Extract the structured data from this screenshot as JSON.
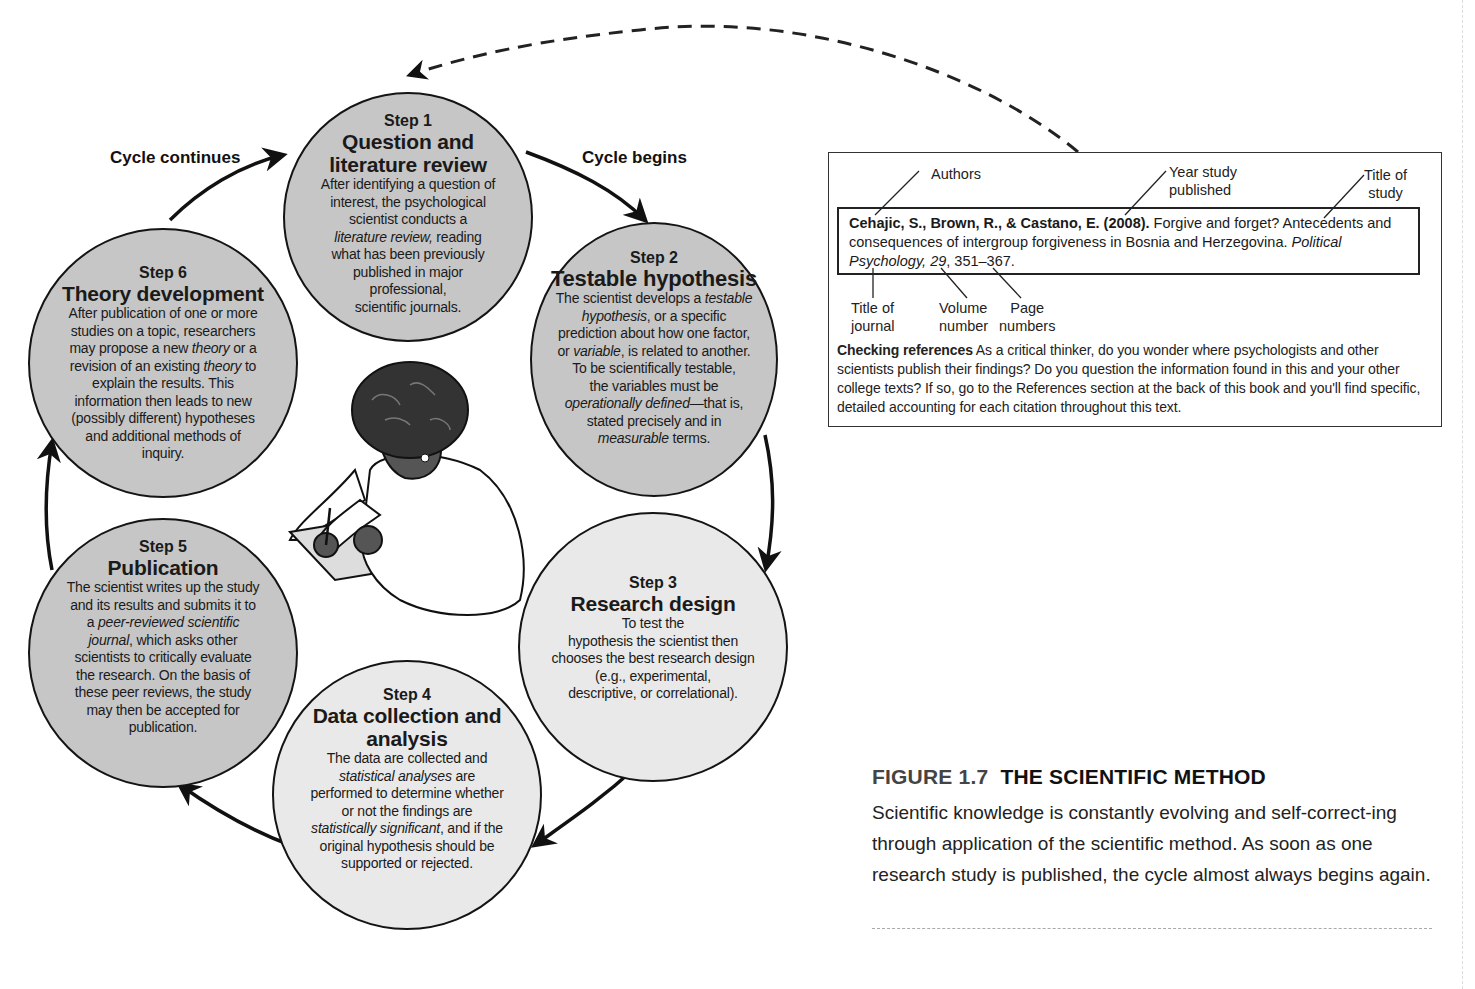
{
  "figure": {
    "number": "FIGURE 1.7",
    "title": "THE SCIENTIFIC METHOD",
    "caption": "Scientific knowledge is constantly evolving and self-correct-ing through application of the scientific method. As soon as one research study is published, the cycle almost always begins again."
  },
  "cycle_labels": {
    "continues": "Cycle continues",
    "begins": "Cycle begins"
  },
  "steps": [
    {
      "number": "Step 1",
      "title_lines": [
        "Question and",
        "literature review"
      ],
      "body_html": "After identifying a question of<br>interest, the psychological<br>scientist conducts a<br><i>literature review,</i> reading<br>what has been previously<br>published in major<br>professional,<br>scientific journals."
    },
    {
      "number": "Step 2",
      "title_lines": [
        "Testable hypothesis"
      ],
      "body_html": "The scientist develops a <i>testable</i><br><i>hypothesis</i>, or a specific<br>prediction about how one factor,<br>or <i>variable</i>, is related to another.<br>To be scientifically testable,<br>the variables must be<br><i>operationally defined</i>—that is,<br>stated precisely and in<br><i>measurable</i> terms."
    },
    {
      "number": "Step 3",
      "title_lines": [
        "Research design"
      ],
      "body_html": "To test the<br>hypothesis the scientist then<br>chooses the best research design<br>(e.g., experimental,<br>descriptive, or correlational)."
    },
    {
      "number": "Step 4",
      "title_lines": [
        "Data collection and",
        "analysis"
      ],
      "body_html": "The data are collected and<br><i>statistical analyses</i> are<br>performed to determine whether<br>or not the findings are<br><i>statistically significant</i>, and if the<br>original hypothesis should be<br>supported or rejected."
    },
    {
      "number": "Step 5",
      "title_lines": [
        "Publication"
      ],
      "body_html": "The scientist writes up the study<br>and its results and submits it to<br>a <i>peer-reviewed scientific</i><br><i>journal</i>, which asks other<br>scientists to critically evaluate<br>the research. On the basis of<br>these peer reviews, the study<br>may then be accepted for<br>publication."
    },
    {
      "number": "Step 6",
      "title_lines": [
        "Theory development"
      ],
      "body_html": "After publication of one or more<br>studies on a topic, researchers<br>may propose a new <i>theory</i> or a<br>revision of an existing <i>theory</i> to<br>explain the results. This<br>information then leads to new<br>(possibly different) hypotheses<br>and additional methods of<br>inquiry."
    }
  ],
  "reference_box": {
    "annotations": {
      "authors": "Authors",
      "year": [
        "Year study",
        "published"
      ],
      "title_of_study": [
        "Title of",
        "study"
      ],
      "title_of_journal": [
        "Title of",
        "journal"
      ],
      "volume": [
        "Volume",
        "number"
      ],
      "pages": [
        "Page",
        "numbers"
      ]
    },
    "citation": {
      "authors_year": "Cehajic, S., Brown, R., & Castano, E. (2008).",
      "article_title": " Forgive and forget? Antecedents and consequences of intergroup forgiveness in Bosnia and Herzegovina. ",
      "journal": "Political Psychology,",
      "volume": "29",
      "pages": ", 351–367."
    },
    "checking": {
      "heading": "Checking references",
      "text": " As a critical thinker, do you wonder where psychologists and other scientists publish their findings? Do you question the information found in this and your other college texts? If so, go to the References section at the back of this book and you'll find specific, detailed accounting for each citation throughout this text."
    }
  },
  "colors": {
    "circle_dark": "#c6c6c6",
    "circle_light": "#e9e9e9",
    "outline": "#141414"
  }
}
